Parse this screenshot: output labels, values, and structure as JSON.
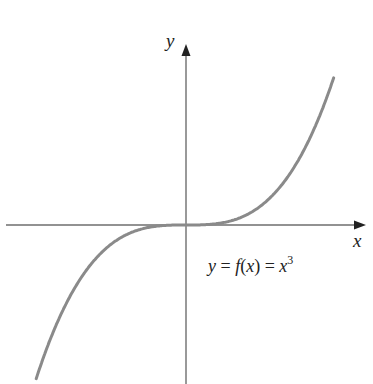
{
  "chart_data": {
    "type": "line",
    "title": "",
    "function": "y = x^3",
    "xlabel": "x",
    "ylabel": "y",
    "annotation": {
      "text_parts": [
        "y",
        " = ",
        "f",
        "(",
        "x",
        ") = ",
        "x",
        "3"
      ],
      "plain": "y = f(x) = x^3"
    },
    "xlim": [
      -1.5,
      1.75
    ],
    "ylim": [
      -1.6,
      1.6
    ],
    "grid": false,
    "ticks": "none",
    "x": [
      -1.4,
      -1.2,
      -1.0,
      -0.8,
      -0.6,
      -0.4,
      -0.2,
      0,
      0.2,
      0.4,
      0.6,
      0.8,
      1.0,
      1.2,
      1.4
    ],
    "values": [
      -2.744,
      -1.728,
      -1.0,
      -0.512,
      -0.216,
      -0.064,
      -0.008,
      0,
      0.008,
      0.064,
      0.216,
      0.512,
      1.0,
      1.728,
      2.744
    ],
    "colors": {
      "curve": "#8a8a8a",
      "axes": "#6e6e6e",
      "arrow": "#222222"
    }
  },
  "labels": {
    "x_axis": "x",
    "y_axis": "y",
    "function_label": {
      "y": "y",
      "eq1": " = ",
      "f": "f",
      "open": "(",
      "x": "x",
      "close": ") = ",
      "xx": "x",
      "exp": "3"
    }
  }
}
